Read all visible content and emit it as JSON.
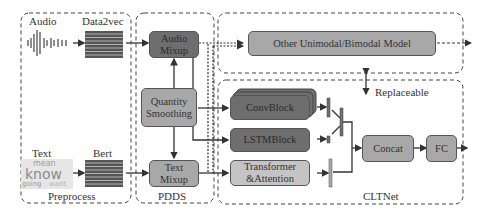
{
  "preprocess": {
    "title": "Preprocess",
    "audio_label": "Audio",
    "audio_encoder": "Data2vec",
    "text_label": "Text",
    "text_encoder": "Bert",
    "word_cloud": [
      "mean",
      "know",
      "going",
      "want"
    ]
  },
  "pdds": {
    "title": "PDDS",
    "audio_mixup": "Audio Mixup",
    "quantity_smoothing": "Quantity Smoothing",
    "text_mixup": "Text Mixup"
  },
  "other_model": {
    "label": "Other Unimodal/Bimodal Model",
    "replaceable": "Replaceable"
  },
  "cltnet": {
    "title": "CLTNet",
    "conv_block": "ConvBlock",
    "lstm_block": "LSTMBlock",
    "transformer": "Transformer &Attention",
    "concat": "Concat",
    "fc": "FC"
  },
  "colors": {
    "dark_block": "#6e6e6e",
    "mid_block": "#a8a8a8",
    "light_block": "#c4c4c4",
    "line": "#333333"
  }
}
